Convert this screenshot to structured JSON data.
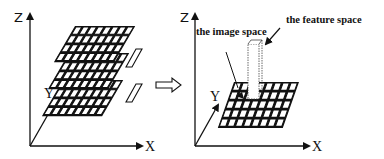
{
  "left_panel": {
    "z_label": "Z",
    "y_label": "Y",
    "x_label": "X",
    "layers": 3,
    "grid_cols": 8,
    "grid_rows_per_layer": 4
  },
  "transition_arrow": "⇨",
  "right_panel": {
    "z_label": "Z",
    "y_label": "Y",
    "x_label": "X",
    "grid_cols": 8,
    "grid_rows": 5,
    "annotations": {
      "feature_space": "the feature space",
      "image_space": "the image space"
    }
  }
}
